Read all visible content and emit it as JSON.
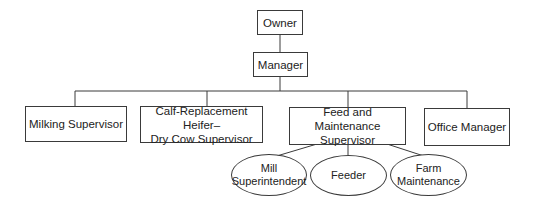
{
  "diagram": {
    "type": "org-chart",
    "nodes": {
      "owner": "Owner",
      "manager": "Manager",
      "milking_supervisor": "Milking Supervisor",
      "calf_supervisor": "Calf-Replacement Heifer–\nDry Cow Supervisor",
      "feed_supervisor": "Feed and Maintenance\nSupervisor",
      "office_manager": "Office Manager",
      "mill_superintendent": "Mill\nSuperintendent",
      "feeder": "Feeder",
      "farm_maintenance": "Farm\nMaintenance"
    },
    "edges": [
      [
        "owner",
        "manager"
      ],
      [
        "manager",
        "milking_supervisor"
      ],
      [
        "manager",
        "calf_supervisor"
      ],
      [
        "manager",
        "feed_supervisor"
      ],
      [
        "manager",
        "office_manager"
      ],
      [
        "feed_supervisor",
        "mill_superintendent"
      ],
      [
        "feed_supervisor",
        "feeder"
      ],
      [
        "feed_supervisor",
        "farm_maintenance"
      ]
    ],
    "colors": {
      "line": "#3a3a3a",
      "text": "#222222",
      "background": "#ffffff"
    }
  }
}
